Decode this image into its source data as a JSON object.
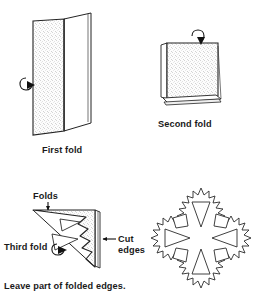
{
  "figure": {
    "background_color": "#ffffff",
    "ink_color": "#232323",
    "paper_fill": "speckled-light-gray"
  },
  "panels": [
    {
      "id": "first-fold",
      "caption": "First fold",
      "description": "Sheet of paper folded once in half, standing open like a card",
      "arrow": "curved-hook-arrow-pointing-right-at-fold"
    },
    {
      "id": "second-fold",
      "caption": "Second fold",
      "description": "Folded paper now a square with stacked layers at bottom",
      "arrow": "curved-hook-arrow-pointing-down-at-top-fold"
    },
    {
      "id": "third-fold",
      "caption": "Third fold",
      "description": "Square folded to a triangle with zigzag cut shapes removed along the cut edge",
      "arrow": "curved-hook-arrow-at-lower-fold"
    },
    {
      "id": "finished-snowflake",
      "caption": "",
      "description": "Unfolded four-fold symmetric snowflake with triangular and quadrilateral cut-outs and jagged edges"
    }
  ],
  "labels": {
    "first_fold": "First fold",
    "second_fold": "Second fold",
    "third_fold": "Third fold",
    "folds": "Folds",
    "cut_edges_line1": "Cut",
    "cut_edges_line2": "edges",
    "footnote": "Leave part of folded edges."
  },
  "annotations": [
    {
      "name": "folds-pointer",
      "text": "Folds",
      "arrow_direction": "down"
    },
    {
      "name": "cut-edges-pointer",
      "text": "Cut edges",
      "arrow_direction": "left"
    },
    {
      "name": "third-fold-pointer",
      "text": "Third fold",
      "arrow_direction": "right"
    }
  ]
}
